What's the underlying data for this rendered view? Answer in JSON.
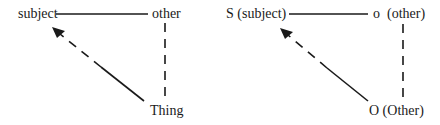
{
  "diagrams": [
    {
      "id": "left",
      "nodes": {
        "subject": "subject",
        "other": "other",
        "thing": "Thing"
      },
      "edges": [
        {
          "from": "subject",
          "to": "other",
          "style": "solid"
        },
        {
          "from": "other",
          "to": "thing",
          "style": "dashed"
        },
        {
          "from": "thing",
          "to": "subject",
          "style": "dashed-then-solid",
          "arrow": "subject"
        }
      ]
    },
    {
      "id": "right",
      "nodes": {
        "subject": "S (subject)",
        "other": "o  (other)",
        "thing": "O (Other)"
      },
      "edges": [
        {
          "from": "subject",
          "to": "other",
          "style": "solid"
        },
        {
          "from": "other",
          "to": "thing",
          "style": "dashed"
        },
        {
          "from": "thing",
          "to": "subject",
          "style": "dashed-then-solid",
          "arrow": "subject"
        }
      ]
    }
  ],
  "colors": {
    "ink": "#1a1a1a",
    "background": "#ffffff"
  }
}
